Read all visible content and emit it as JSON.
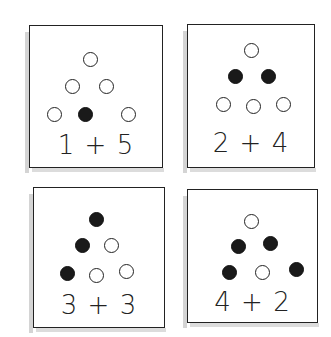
{
  "cards": [
    {
      "label": "1 + 5",
      "filled": 1,
      "empty": 5
    },
    {
      "label": "2 + 4",
      "filled": 2,
      "empty": 4
    },
    {
      "label": "3 + 3",
      "filled": 3,
      "empty": 3
    },
    {
      "label": "4 + 2",
      "filled": 4,
      "empty": 2
    }
  ],
  "colors": {
    "ink": "#222222",
    "filled_dot": "#1a1a1a",
    "card_bg": "#ffffff",
    "shadow": "#d4d4d4"
  }
}
